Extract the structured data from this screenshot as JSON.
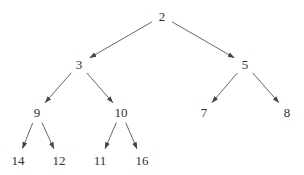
{
  "diagram": {
    "type": "tree",
    "directed": true,
    "colors": {
      "text": "#333333",
      "edge": "#555555",
      "background": "#ffffff"
    },
    "nodes": [
      {
        "id": "n2",
        "label": "2",
        "x": 162,
        "y": 16
      },
      {
        "id": "n3",
        "label": "3",
        "x": 79,
        "y": 64
      },
      {
        "id": "n5",
        "label": "5",
        "x": 245,
        "y": 64
      },
      {
        "id": "n9",
        "label": "9",
        "x": 37,
        "y": 112
      },
      {
        "id": "n10",
        "label": "10",
        "x": 121,
        "y": 112
      },
      {
        "id": "n7",
        "label": "7",
        "x": 204,
        "y": 112
      },
      {
        "id": "n8",
        "label": "8",
        "x": 287,
        "y": 112
      },
      {
        "id": "n14",
        "label": "14",
        "x": 18,
        "y": 160
      },
      {
        "id": "n12",
        "label": "12",
        "x": 59,
        "y": 160
      },
      {
        "id": "n11",
        "label": "11",
        "x": 100,
        "y": 160
      },
      {
        "id": "n16",
        "label": "16",
        "x": 142,
        "y": 160
      }
    ],
    "edges": [
      {
        "from": "n2",
        "to": "n3"
      },
      {
        "from": "n2",
        "to": "n5"
      },
      {
        "from": "n3",
        "to": "n9"
      },
      {
        "from": "n3",
        "to": "n10"
      },
      {
        "from": "n5",
        "to": "n7"
      },
      {
        "from": "n5",
        "to": "n8"
      },
      {
        "from": "n9",
        "to": "n14"
      },
      {
        "from": "n9",
        "to": "n12"
      },
      {
        "from": "n10",
        "to": "n11"
      },
      {
        "from": "n10",
        "to": "n16"
      }
    ]
  }
}
